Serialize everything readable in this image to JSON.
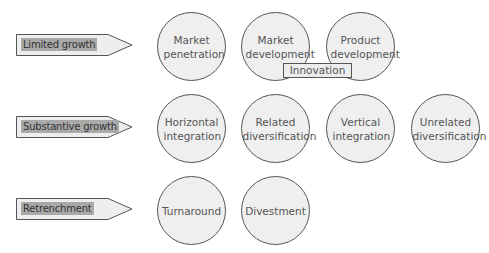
{
  "rows": [
    {
      "category": "Limited growth",
      "strategies": [
        "Market penetration",
        "Market development",
        "Product development"
      ]
    },
    {
      "category": "Substantive growth",
      "strategies": [
        "Horizontal integration",
        "Related diversification",
        "Vertical integration",
        "Unrelated diversification"
      ]
    },
    {
      "category": "Retrenchment",
      "strategies": [
        "Turnaround",
        "Divestment"
      ]
    }
  ],
  "overlay": {
    "label": "Innovation"
  },
  "colors": {
    "circle_fill": "#efefef",
    "arrow_fill": "#eeeeee",
    "label_highlight": "#a9a9a9",
    "stroke": "#555555"
  }
}
